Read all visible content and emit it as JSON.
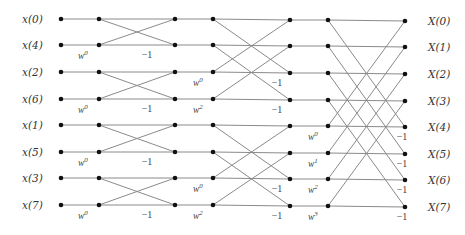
{
  "inputs": [
    "x(0)",
    "x(4)",
    "x(2)",
    "x(6)",
    "x(1)",
    "x(5)",
    "x(3)",
    "x(7)"
  ],
  "outputs": [
    "X(0)",
    "X(1)",
    "X(2)",
    "X(3)",
    "X(4)",
    "X(5)",
    "X(6)",
    "X(7)"
  ],
  "twiddle_base": "w",
  "minus_one": "−1",
  "stages": [
    {
      "name": "stage-1",
      "butterfly_span": 1,
      "twiddles": [
        {
          "row": 1,
          "exp": "0"
        },
        {
          "row": 3,
          "exp": "0"
        },
        {
          "row": 5,
          "exp": "0"
        },
        {
          "row": 7,
          "exp": "0"
        }
      ],
      "minus_one_rows": [
        1,
        3,
        5,
        7
      ]
    },
    {
      "name": "stage-2",
      "butterfly_span": 2,
      "twiddles": [
        {
          "row": 2,
          "exp": "0"
        },
        {
          "row": 3,
          "exp": "2"
        },
        {
          "row": 6,
          "exp": "0"
        },
        {
          "row": 7,
          "exp": "2"
        }
      ],
      "minus_one_rows": [
        2,
        3,
        6,
        7
      ]
    },
    {
      "name": "stage-3",
      "butterfly_span": 4,
      "twiddles": [
        {
          "row": 4,
          "exp": "0"
        },
        {
          "row": 5,
          "exp": "1"
        },
        {
          "row": 6,
          "exp": "2"
        },
        {
          "row": 7,
          "exp": "3"
        }
      ],
      "minus_one_rows": [
        4,
        5,
        6,
        7
      ]
    }
  ],
  "colors": {
    "edge": "#8a8a8a",
    "node": "#111111",
    "text": "#333333"
  }
}
